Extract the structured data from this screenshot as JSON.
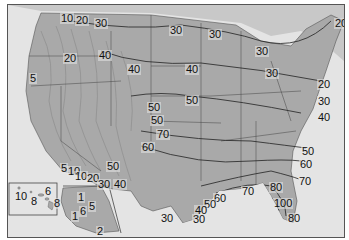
{
  "map": {
    "region": "United States",
    "style": "grayscale shaded relief with isolines",
    "colors": {
      "land": "#a9a9a9",
      "ocean": "#e4e4e4",
      "lines": "#333333",
      "border": "#555555"
    },
    "labels": [
      {
        "text": "10",
        "x": 59,
        "y": 12
      },
      {
        "text": "20",
        "x": 74,
        "y": 14
      },
      {
        "text": "30",
        "x": 93,
        "y": 17
      },
      {
        "text": "20",
        "x": 62,
        "y": 52
      },
      {
        "text": "40",
        "x": 97,
        "y": 49
      },
      {
        "text": "5",
        "x": 27,
        "y": 72
      },
      {
        "text": "30",
        "x": 168,
        "y": 24
      },
      {
        "text": "30",
        "x": 207,
        "y": 28
      },
      {
        "text": "40",
        "x": 126,
        "y": 63
      },
      {
        "text": "40",
        "x": 184,
        "y": 63
      },
      {
        "text": "30",
        "x": 254,
        "y": 45
      },
      {
        "text": "30",
        "x": 264,
        "y": 67
      },
      {
        "text": "20",
        "x": 333,
        "y": 17
      },
      {
        "text": "20",
        "x": 316,
        "y": 78
      },
      {
        "text": "30",
        "x": 316,
        "y": 95
      },
      {
        "text": "40",
        "x": 316,
        "y": 111
      },
      {
        "text": "50",
        "x": 184,
        "y": 94
      },
      {
        "text": "50",
        "x": 146,
        "y": 101
      },
      {
        "text": "50",
        "x": 149,
        "y": 114
      },
      {
        "text": "70",
        "x": 155,
        "y": 128
      },
      {
        "text": "60",
        "x": 140,
        "y": 141
      },
      {
        "text": "50",
        "x": 105,
        "y": 160
      },
      {
        "text": "5",
        "x": 59,
        "y": 162
      },
      {
        "text": "10",
        "x": 67,
        "y": 165
      },
      {
        "text": "10",
        "x": 73,
        "y": 170
      },
      {
        "text": "20",
        "x": 85,
        "y": 172
      },
      {
        "text": "30",
        "x": 96,
        "y": 178
      },
      {
        "text": "40",
        "x": 112,
        "y": 178
      },
      {
        "text": "10",
        "x": 13,
        "y": 190
      },
      {
        "text": "8",
        "x": 29,
        "y": 195
      },
      {
        "text": "6",
        "x": 43,
        "y": 185
      },
      {
        "text": "8",
        "x": 52,
        "y": 197
      },
      {
        "text": "1",
        "x": 76,
        "y": 191
      },
      {
        "text": "6",
        "x": 78,
        "y": 205
      },
      {
        "text": "5",
        "x": 87,
        "y": 200
      },
      {
        "text": "1",
        "x": 70,
        "y": 210
      },
      {
        "text": "2",
        "x": 95,
        "y": 225
      },
      {
        "text": "50",
        "x": 300,
        "y": 145
      },
      {
        "text": "60",
        "x": 298,
        "y": 158
      },
      {
        "text": "70",
        "x": 297,
        "y": 175
      },
      {
        "text": "70",
        "x": 240,
        "y": 185
      },
      {
        "text": "80",
        "x": 268,
        "y": 181
      },
      {
        "text": "100",
        "x": 272,
        "y": 197
      },
      {
        "text": "80",
        "x": 286,
        "y": 212
      },
      {
        "text": "60",
        "x": 212,
        "y": 192
      },
      {
        "text": "50",
        "x": 202,
        "y": 198
      },
      {
        "text": "40",
        "x": 193,
        "y": 204
      },
      {
        "text": "30",
        "x": 191,
        "y": 213
      },
      {
        "text": "30",
        "x": 159,
        "y": 212
      }
    ],
    "insets": [
      {
        "name": "Hawaii",
        "labels": [
          "10",
          "8",
          "6",
          "8"
        ]
      },
      {
        "name": "Alaska",
        "labels": [
          "1",
          "6",
          "5",
          "1",
          "2"
        ]
      }
    ]
  }
}
